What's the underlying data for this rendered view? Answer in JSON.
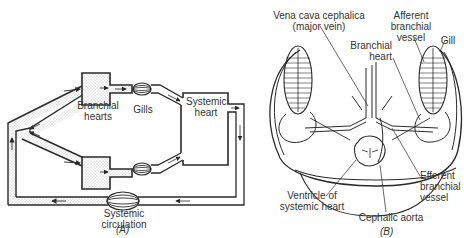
{
  "figure_a": {
    "caption": "(A)",
    "labels": {
      "branchial_hearts_1": "Branchial",
      "branchial_hearts_2": "hearts",
      "gills": "Gills",
      "systemic_heart_1": "Systemic",
      "systemic_heart_2": "heart",
      "systemic_circulation_1": "Systemic",
      "systemic_circulation_2": "circulation"
    }
  },
  "figure_b": {
    "caption": "(B)",
    "labels": {
      "vena_cava_1": "Vena cava cephalica",
      "vena_cava_2": "(major vein)",
      "afferent_1": "Afferent",
      "afferent_2": "branchial",
      "afferent_3": "vessel",
      "gill": "Gill",
      "branchial_heart_1": "Branchial",
      "branchial_heart_2": "heart",
      "ventricle_1": "Ventricle of",
      "ventricle_2": "systemic heart",
      "cephalic_aorta": "Cephalic aorta",
      "efferent_1": "Efferent",
      "efferent_2": "branchial",
      "efferent_3": "vessel"
    }
  },
  "colors": {
    "line": "#2a2a2a",
    "stipple": "#d9d9d9",
    "background": "#ffffff"
  }
}
